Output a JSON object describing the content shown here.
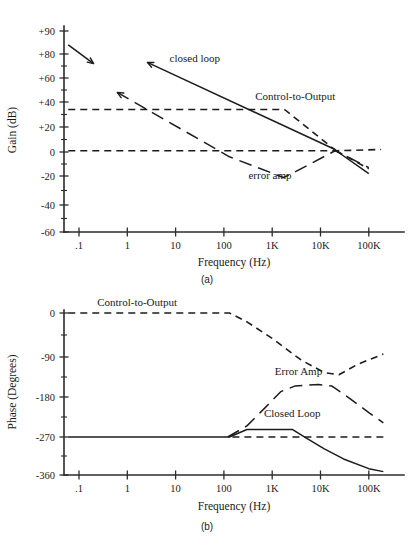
{
  "figure": {
    "caption_a": "(a)",
    "caption_b": "(b)"
  },
  "chart_data": [
    {
      "id": "gain",
      "type": "line",
      "title": "",
      "xlabel": "Frequency (Hz)",
      "ylabel": "Gain (dB)",
      "xscale": "log",
      "xlim": [
        0.05,
        300000
      ],
      "ylim": [
        -60,
        95
      ],
      "grid": false,
      "xtick_labels": [
        ".1",
        "1",
        "10",
        "100",
        "1K",
        "10K",
        "100K"
      ],
      "xtick_values": [
        0.1,
        1,
        10,
        100,
        1000,
        10000,
        100000
      ],
      "ytick_labels": [
        "+90",
        "+80",
        "+60",
        "+40",
        "+20",
        "0",
        "-20",
        "-40",
        "-60"
      ],
      "ytick_values": [
        90,
        80,
        60,
        40,
        20,
        0,
        -20,
        -40,
        -60
      ],
      "legend_position": "inline-annotations",
      "annotations": [
        {
          "text": "closed loop",
          "x": 25,
          "y": 73
        },
        {
          "text": "Control-to-Output",
          "x": 3000,
          "y": 42
        },
        {
          "text": "error amp",
          "x": 900,
          "y": -22
        }
      ],
      "series": [
        {
          "name": "closed loop",
          "style": "solid",
          "points": [
            [
              0.06,
              84
            ],
            [
              0.2,
              72
            ]
          ],
          "arrow_end": true
        },
        {
          "name": "closed loop",
          "style": "solid",
          "points": [
            [
              2.6,
              73
            ],
            [
              20000,
              2
            ],
            [
              23000,
              0
            ],
            [
              100000,
              -18
            ]
          ],
          "arrow_start": true
        },
        {
          "name": "error amp",
          "style": "longdash",
          "points": [
            [
              0.62,
              48
            ],
            [
              130,
              -4
            ],
            [
              1700,
              -21
            ],
            [
              2300,
              -19
            ],
            [
              20000,
              1
            ],
            [
              23000,
              0
            ],
            [
              100000,
              -13
            ]
          ],
          "arrow_start": true
        },
        {
          "name": "Control-to-Output",
          "style": "shortdash",
          "points": [
            [
              0.06,
              34
            ],
            [
              1800,
              34
            ],
            [
              21000,
              1
            ]
          ]
        },
        {
          "name": "Control-to-Output",
          "style": "shortdash",
          "points": [
            [
              0.06,
              1
            ],
            [
              21000,
              1
            ],
            [
              180000,
              2
            ]
          ]
        },
        {
          "name": "Control-to-Output",
          "style": "shortdash",
          "points": [
            [
              21000,
              1
            ],
            [
              100000,
              -14
            ]
          ]
        }
      ]
    },
    {
      "id": "phase",
      "type": "line",
      "title": "",
      "xlabel": "Frequency (Hz)",
      "ylabel": "Phase (Degrees)",
      "xscale": "log",
      "xlim": [
        0.05,
        300000
      ],
      "ylim": [
        -360,
        10
      ],
      "grid": false,
      "xtick_labels": [
        ".1",
        "1",
        "10",
        "100",
        "1K",
        "10K",
        "100K"
      ],
      "xtick_values": [
        0.1,
        1,
        10,
        100,
        1000,
        10000,
        100000
      ],
      "ytick_labels": [
        "0",
        "-90",
        "-180",
        "-270",
        "-360"
      ],
      "ytick_values": [
        0,
        -90,
        -180,
        -270,
        -360
      ],
      "legend_position": "inline-annotations",
      "annotations": [
        {
          "text": "Control-to-Output",
          "x": 1.6,
          "y": 14
        },
        {
          "text": "Error Amp",
          "x": 3500,
          "y": -130
        },
        {
          "text": "Closed Loop",
          "x": 2600,
          "y": -225
        }
      ],
      "series": [
        {
          "name": "Control-to-Output",
          "style": "shortdash",
          "points": [
            [
              0.06,
              0
            ],
            [
              130,
              0
            ],
            [
              300,
              -18
            ],
            [
              1000,
              -52
            ],
            [
              4000,
              -97
            ],
            [
              12000,
              -125
            ],
            [
              24000,
              -130
            ],
            [
              60000,
              -106
            ],
            [
              200000,
              -84
            ]
          ]
        },
        {
          "name": "Error Amp",
          "style": "longdash",
          "points": [
            [
              120,
              -270
            ],
            [
              300,
              -245
            ],
            [
              700,
              -205
            ],
            [
              1500,
              -168
            ],
            [
              3000,
              -155
            ],
            [
              9000,
              -152
            ],
            [
              17000,
              -155
            ],
            [
              40000,
              -183
            ],
            [
              100000,
              -215
            ],
            [
              200000,
              -238
            ]
          ]
        },
        {
          "name": "Closed Loop",
          "style": "solid",
          "points": [
            [
              0.06,
              -270
            ],
            [
              130,
              -270
            ],
            [
              300,
              -253
            ],
            [
              2600,
              -253
            ],
            [
              5000,
              -272
            ],
            [
              12000,
              -298
            ],
            [
              30000,
              -322
            ],
            [
              100000,
              -345
            ],
            [
              200000,
              -352
            ]
          ]
        },
        {
          "name": "Closed Loop baseline",
          "style": "shortdash",
          "points": [
            [
              150,
              -270
            ],
            [
              200000,
              -270
            ]
          ]
        }
      ]
    }
  ]
}
